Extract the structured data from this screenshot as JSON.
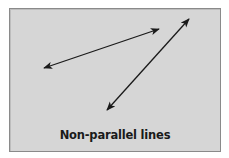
{
  "figure": {
    "caption": "Non-parallel lines",
    "background_color": "#d6d6d6",
    "border_color": "#8a8a8a",
    "line_color": "#1a1a1a"
  },
  "lines": [
    {
      "name": "line-1",
      "x1": 44,
      "y1": 68,
      "x2": 159,
      "y2": 29,
      "arrows": "both"
    },
    {
      "name": "line-2",
      "x1": 107,
      "y1": 110,
      "x2": 189,
      "y2": 19,
      "arrows": "both"
    }
  ]
}
